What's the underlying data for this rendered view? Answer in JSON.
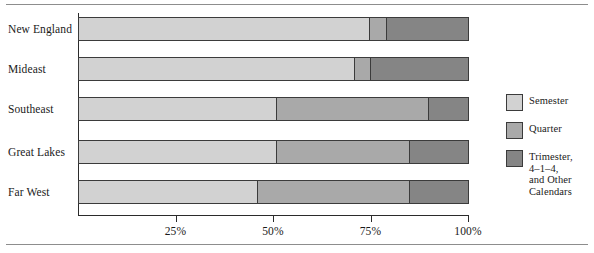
{
  "chart_data": {
    "type": "bar",
    "orientation": "horizontal",
    "stacked": true,
    "normalized_percent": true,
    "title": "",
    "subtitle": "",
    "xlabel": "",
    "ylabel": "",
    "xlim": [
      0,
      100
    ],
    "grid": false,
    "legend_position": "right",
    "categories": [
      "New England",
      "Mideast",
      "Southeast",
      "Great Lakes",
      "Far West"
    ],
    "tick_labels": [
      "25%",
      "50%",
      "75%",
      "100%"
    ],
    "tick_values": [
      25,
      50,
      75,
      100
    ],
    "series": [
      {
        "name": "Semester",
        "color": "#d2d2d2",
        "values": [
          75,
          71,
          51,
          51,
          46
        ]
      },
      {
        "name": "Quarter",
        "color": "#a9a9a9",
        "values": [
          4,
          4,
          39,
          34,
          39
        ]
      },
      {
        "name": "Trimester,\n4–1–4,\nand Other\nCalendars",
        "color": "#858585",
        "values": [
          21,
          25,
          10,
          15,
          15
        ]
      }
    ]
  },
  "legend": {
    "items": [
      {
        "label": "Semester",
        "color": "#d2d2d2"
      },
      {
        "label": "Quarter",
        "color": "#a9a9a9"
      },
      {
        "label": "Trimester,\n4–1–4,\nand Other\nCalendars",
        "color": "#858585"
      }
    ]
  },
  "axis": {
    "ticks": [
      {
        "label": "25%",
        "value": 25
      },
      {
        "label": "50%",
        "value": 50
      },
      {
        "label": "75%",
        "value": 75
      },
      {
        "label": "100%",
        "value": 100
      }
    ]
  },
  "rows": [
    {
      "label": "New England",
      "segments": [
        75,
        4,
        21
      ]
    },
    {
      "label": "Mideast",
      "segments": [
        71,
        4,
        25
      ]
    },
    {
      "label": "Southeast",
      "segments": [
        51,
        39,
        10
      ]
    },
    {
      "label": "Great Lakes",
      "segments": [
        51,
        34,
        15
      ]
    },
    {
      "label": "Far West",
      "segments": [
        46,
        39,
        15
      ]
    }
  ]
}
